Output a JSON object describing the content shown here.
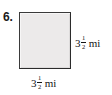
{
  "exercise": {
    "number_label": "6."
  },
  "figure": {
    "shape_name": "square",
    "fill_color": "#eceaea",
    "border_color": "#2b2b2b",
    "background_color": "#ffffff",
    "text_color": "#141414"
  },
  "labels": {
    "right": {
      "whole": "3",
      "numerator": "1",
      "denominator": "2",
      "unit": "mi",
      "full_text": "3 1/2 mi"
    },
    "bottom": {
      "whole": "3",
      "numerator": "1",
      "denominator": "2",
      "unit": "mi",
      "full_text": "3 1/2 mi"
    }
  },
  "chart_data": {
    "type": "diagram",
    "title": "",
    "shape": "square",
    "side_length_value": 3.5,
    "side_length_text": "3 1/2",
    "unit": "mi",
    "dimensions": [
      {
        "position": "bottom",
        "value": 3.5,
        "text": "3 1/2 mi"
      },
      {
        "position": "right",
        "value": 3.5,
        "text": "3 1/2 mi"
      }
    ]
  }
}
